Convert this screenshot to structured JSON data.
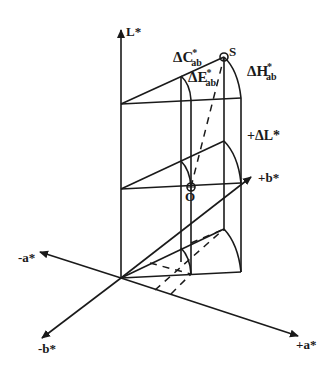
{
  "diagram": {
    "axes": {
      "L": "L*",
      "plus_a": "+a*",
      "minus_a": "-a*",
      "plus_b": "+b*",
      "minus_b": "-b*"
    },
    "points": {
      "sample": "S",
      "origin_ref": "O"
    },
    "differences": {
      "delta_C": {
        "symbol": "ΔC",
        "sup": "*",
        "sub": "ab"
      },
      "delta_E": {
        "symbol": "ΔE",
        "sup": "*",
        "sub": "ab"
      },
      "delta_H": {
        "symbol": "ΔH",
        "sup": "*",
        "sub": "ab"
      },
      "delta_L": "+ΔL*"
    },
    "colors": {
      "line": "#1a1a1a",
      "background": "#ffffff"
    }
  }
}
